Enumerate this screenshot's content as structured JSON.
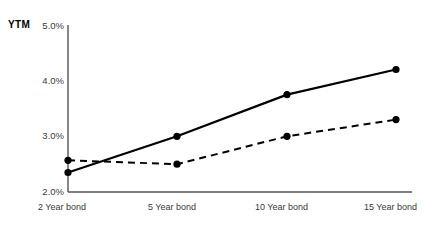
{
  "chart_data": {
    "type": "line",
    "title": "",
    "subtitle": "",
    "ylabel": "YTM",
    "xlabel": "",
    "categories": [
      "2 Year bond",
      "5 Year bond",
      "10 Year bond",
      "15 Year bond"
    ],
    "yticklabels": [
      "5.0%",
      "4.0%",
      "3.0%",
      "2.0%"
    ],
    "ytickvalues": [
      5.0,
      4.0,
      3.0,
      2.0
    ],
    "ylim": [
      2.0,
      5.0
    ],
    "grid": false,
    "legend": "none",
    "series": [
      {
        "name": "solid-series",
        "style": "solid",
        "color": "#000000",
        "marker": "circle",
        "values": [
          2.35,
          3.0,
          3.75,
          4.2
        ]
      },
      {
        "name": "dashed-series",
        "style": "dashed",
        "color": "#000000",
        "marker": "circle",
        "values": [
          2.57,
          2.5,
          3.0,
          3.3
        ]
      }
    ]
  },
  "axes": {
    "y_axis_label": "YTM",
    "tick_0": "5.0%",
    "tick_1": "4.0%",
    "tick_2": "3.0%",
    "tick_3": "2.0%",
    "x_0": "2 Year bond",
    "x_1": "5 Year bond",
    "x_2": "10 Year bond",
    "x_3": "15 Year bond"
  },
  "colors": {
    "line": "#000000",
    "axis": "#555555",
    "text": "#3a3a3a"
  }
}
